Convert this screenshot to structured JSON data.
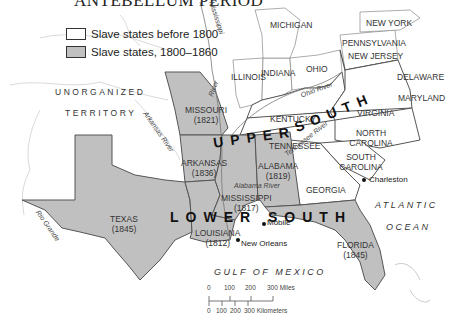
{
  "title": "ANTEBELLUM PERIOD",
  "legend": {
    "items": [
      {
        "label": "Slave states before 1800",
        "color": "#ffffff"
      },
      {
        "label": "Slave states, 1800–1860",
        "color": "#c0c0c0"
      }
    ]
  },
  "colors": {
    "new_slave_state_fill": "#c0c0c0",
    "old_slave_state_fill": "#ffffff",
    "border": "#555555",
    "water": "#ffffff"
  },
  "states": {
    "michigan": {
      "name": "MICHIGAN"
    },
    "new_york": {
      "name": "NEW YORK"
    },
    "pennsylvania": {
      "name": "PENNSYLVANIA"
    },
    "new_jersey": {
      "name": "NEW JERSEY"
    },
    "illinois": {
      "name": "ILLINOIS"
    },
    "indiana": {
      "name": "INDIANA"
    },
    "ohio": {
      "name": "OHIO"
    },
    "delaware": {
      "name": "DELAWARE"
    },
    "maryland": {
      "name": "MARYLAND"
    },
    "missouri": {
      "name": "MISSOURI",
      "year": "(1821)"
    },
    "kentucky": {
      "name": "KENTUCKY"
    },
    "virginia": {
      "name": "VIRGINIA"
    },
    "tennessee": {
      "name": "TENNESSEE"
    },
    "north_carolina": {
      "name": "NORTH CAROLINA"
    },
    "arkansas": {
      "name": "ARKANSAS",
      "year": "(1836)"
    },
    "alabama": {
      "name": "ALABAMA",
      "year": "(1819)"
    },
    "south_carolina": {
      "name": "SOUTH CAROLINA"
    },
    "georgia": {
      "name": "GEORGIA"
    },
    "mississippi": {
      "name": "MISSISSIPPI",
      "year": "(1817)"
    },
    "texas": {
      "name": "TEXAS",
      "year": "(1845)"
    },
    "louisiana": {
      "name": "LOUISIANA",
      "year": "(1812)"
    },
    "florida": {
      "name": "FLORIDA",
      "year": "(1845)"
    }
  },
  "territories": {
    "unorganized_line1": "UNORGANIZED",
    "unorganized_line2": "TERRITORY"
  },
  "regions": {
    "upper": "UPPER",
    "upper_south": "SOUTH",
    "lower": "LOWER",
    "lower_south": "SOUTH"
  },
  "rivers": {
    "mississippi": "Mississippi",
    "missouri": "River",
    "ohio": "Ohio River",
    "arkansas": "Arkansas River",
    "tennessee": "Tennessee River",
    "alabama": "Alabama River",
    "rio_grande": "Rio Grande"
  },
  "cities": {
    "charleston": "Charleston",
    "mobile": "Mobile",
    "new_orleans": "New Orleans"
  },
  "water": {
    "atlantic": "ATLANTIC",
    "ocean": "OCEAN",
    "gulf": "GULF OF MEXICO"
  },
  "scale": {
    "miles_ticks": [
      "0",
      "100",
      "200",
      "300 Miles"
    ],
    "km_ticks": [
      "0",
      "100",
      "200",
      "300 Kilometers"
    ]
  }
}
